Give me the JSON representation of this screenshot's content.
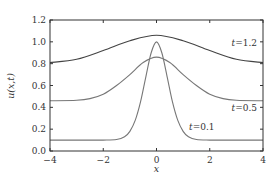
{
  "chart_data": {
    "type": "line",
    "title": "",
    "xlabel": "x",
    "ylabel": "u(x,t)",
    "xlim": [
      -4,
      4
    ],
    "ylim": [
      0,
      1.2
    ],
    "grid": false,
    "legend": "none (inline annotations)",
    "xticks": [
      -4,
      -2,
      0,
      2,
      4
    ],
    "xtick_labels": [
      "−4",
      "−2",
      "0",
      "2",
      "4"
    ],
    "yticks": [
      0.0,
      0.2,
      0.4,
      0.6,
      0.8,
      1.0,
      1.2
    ],
    "ytick_labels": [
      "0.0",
      "0.2",
      "0.4",
      "0.6",
      "0.8",
      "1.0",
      "1.2"
    ],
    "series": [
      {
        "name": "t=0.1",
        "label_text": "t=0.1",
        "color": "#777777",
        "x": [
          -4,
          -3,
          -2,
          -1.5,
          -1.2,
          -1.0,
          -0.8,
          -0.6,
          -0.4,
          -0.2,
          0,
          0.2,
          0.4,
          0.6,
          0.8,
          1.0,
          1.2,
          1.5,
          2,
          3,
          4
        ],
        "y": [
          0.1,
          0.1,
          0.1,
          0.105,
          0.13,
          0.18,
          0.28,
          0.45,
          0.68,
          0.9,
          1.0,
          0.9,
          0.68,
          0.45,
          0.28,
          0.18,
          0.13,
          0.105,
          0.1,
          0.1,
          0.1
        ]
      },
      {
        "name": "t=0.5",
        "label_text": "t=0.5",
        "color": "#777777",
        "x": [
          -4,
          -3,
          -2.5,
          -2,
          -1.5,
          -1.0,
          -0.5,
          0,
          0.5,
          1.0,
          1.5,
          2,
          2.5,
          3,
          4
        ],
        "y": [
          0.46,
          0.465,
          0.48,
          0.52,
          0.6,
          0.7,
          0.81,
          0.86,
          0.81,
          0.7,
          0.6,
          0.52,
          0.48,
          0.465,
          0.46
        ]
      },
      {
        "name": "t=1.2",
        "label_text": "t=1.2",
        "color": "#444444",
        "x": [
          -4,
          -3,
          -2,
          -1,
          0,
          1,
          2,
          3,
          4
        ],
        "y": [
          0.81,
          0.84,
          0.92,
          1.01,
          1.06,
          1.01,
          0.92,
          0.84,
          0.81
        ]
      }
    ],
    "annotations": [
      {
        "text": "t=1.2",
        "x": 3.3,
        "y": 0.96
      },
      {
        "text": "t=0.5",
        "x": 3.3,
        "y": 0.37
      },
      {
        "text": "t=0.1",
        "x": 1.7,
        "y": 0.19
      }
    ]
  }
}
